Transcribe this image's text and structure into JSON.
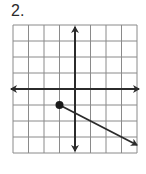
{
  "problem": {
    "label": "2."
  },
  "chart_data": {
    "type": "line",
    "title": "",
    "xlabel": "",
    "ylabel": "",
    "grid": true,
    "xlim": [
      -4,
      4
    ],
    "ylim": [
      -4,
      4
    ],
    "grid_step": 1,
    "axes": {
      "x_arrows": true,
      "y_arrows": true
    },
    "series": [
      {
        "name": "ray",
        "kind": "ray",
        "start": {
          "x": -1,
          "y": -1,
          "closed": true
        },
        "end": {
          "x": 4,
          "y": -3.5,
          "arrow": true
        },
        "slope": -0.5,
        "points": [
          {
            "x": -1,
            "y": -1
          },
          {
            "x": 1,
            "y": -2
          },
          {
            "x": 3,
            "y": -3
          },
          {
            "x": 4,
            "y": -3.5
          }
        ]
      }
    ]
  },
  "colors": {
    "grid": "#8a8a8a",
    "axis": "#2b2b2b",
    "ray": "#2b2b2b",
    "point": "#1a1a1a",
    "border": "#7a7a7a"
  },
  "layout": {
    "left": 13,
    "top": 25,
    "right": 137,
    "bottom": 153
  }
}
